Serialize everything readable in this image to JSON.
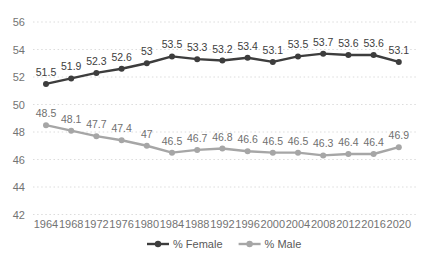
{
  "chart_data": {
    "type": "line",
    "title": "",
    "xlabel": "",
    "ylabel": "",
    "x": [
      1964,
      1968,
      1972,
      1976,
      1980,
      1984,
      1988,
      1992,
      1996,
      2000,
      2004,
      2008,
      2012,
      2016,
      2020
    ],
    "series": [
      {
        "name": "% Female",
        "values": [
          51.5,
          51.9,
          52.3,
          52.6,
          53,
          53.5,
          53.3,
          53.2,
          53.4,
          53.1,
          53.5,
          53.7,
          53.6,
          53.6,
          53.1
        ],
        "color": "#3d3d3d",
        "label_color": "#3d3d3d"
      },
      {
        "name": "% Male",
        "values": [
          48.5,
          48.1,
          47.7,
          47.4,
          47,
          46.5,
          46.7,
          46.8,
          46.6,
          46.5,
          46.5,
          46.3,
          46.4,
          46.4,
          46.9
        ],
        "color": "#a6a6a6",
        "label_color": "#6f6f6f"
      }
    ],
    "ylim": [
      42,
      56
    ],
    "yticks": [
      42,
      44,
      46,
      48,
      50,
      52,
      54,
      56
    ],
    "grid": true,
    "gridline_style": "dotted",
    "data_labels": true,
    "legend_position": "bottom-center"
  },
  "colors": {
    "background": "#ffffff",
    "gridline": "#dcdcdc",
    "tick_label": "#737373",
    "legend_text": "#595959"
  }
}
